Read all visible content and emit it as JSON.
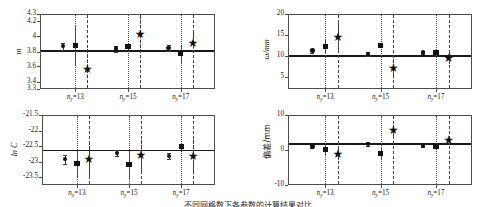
{
  "figure": {
    "caption": "不同网格数下各参数的计算结果对比",
    "group_labels": [
      "n",
      "=13",
      "n",
      "=15",
      "n",
      "=17"
    ],
    "group_var": "n",
    "group_sub": "y",
    "group_values": [
      "13",
      "15",
      "17"
    ]
  },
  "chart_data": [
    {
      "id": "panel-m",
      "type": "scatter",
      "title": "",
      "xlabel": "",
      "ylabel": "m",
      "ylabel_style": "italic",
      "ylim": [
        3.3,
        4.3
      ],
      "yticks": [
        3.3,
        3.4,
        3.6,
        3.8,
        4.0,
        4.2,
        4.3
      ],
      "ytick_labels": [
        "3.3",
        "3.4",
        "3.6",
        "3.8",
        "4",
        "4.2",
        "4.3"
      ],
      "categories": [
        "n_y=13",
        "n_y=15",
        "n_y=17"
      ],
      "reference_line": 3.82,
      "grid": false,
      "legend": "none",
      "series": [
        {
          "name": "circle",
          "marker": "circle",
          "x": [
            0.74,
            1.74,
            2.74
          ],
          "values": [
            3.87,
            3.84,
            3.85
          ],
          "err_low": [
            0.05,
            0.04,
            0.04
          ],
          "err_high": [
            0.05,
            0.04,
            0.04
          ],
          "err_style": "solid"
        },
        {
          "name": "square",
          "marker": "square",
          "x": [
            0.97,
            1.97,
            2.97
          ],
          "values": [
            3.88,
            3.87,
            3.77
          ],
          "err_low": [
            0.26,
            0.15,
            0.12
          ],
          "err_high": [
            0.26,
            0.15,
            0.12
          ],
          "err_style": "dotted"
        },
        {
          "name": "star",
          "marker": "star",
          "x": [
            1.2,
            2.2,
            3.2
          ],
          "values": [
            3.57,
            4.04,
            3.92
          ],
          "err_low": [
            0.27,
            0.24,
            0.14
          ],
          "err_high": [
            0.27,
            0.24,
            0.14
          ],
          "err_style": "dashed"
        }
      ]
    },
    {
      "id": "panel-omega",
      "type": "scatter",
      "title": "",
      "xlabel": "",
      "ylabel": "ω/mm",
      "ylabel_style": "italic",
      "ylim": [
        2.0,
        20.0
      ],
      "yticks": [
        5,
        10,
        15,
        20
      ],
      "ytick_labels": [
        "5",
        "10",
        "15",
        "20"
      ],
      "categories": [
        "n_y=13",
        "n_y=15",
        "n_y=17"
      ],
      "reference_line": 10.1,
      "grid": false,
      "legend": "none",
      "series": [
        {
          "name": "circle",
          "marker": "circle",
          "x": [
            0.74,
            1.74,
            2.74
          ],
          "values": [
            11.2,
            10.4,
            10.8
          ],
          "err_low": [
            0.5,
            0.4,
            0.4
          ],
          "err_high": [
            0.5,
            0.4,
            0.4
          ],
          "err_style": "solid"
        },
        {
          "name": "square",
          "marker": "square",
          "x": [
            0.97,
            1.97,
            2.97
          ],
          "values": [
            12.2,
            12.4,
            10.7
          ],
          "err_low": [
            1.6,
            1.5,
            0.9
          ],
          "err_high": [
            1.6,
            1.5,
            0.9
          ],
          "err_style": "dotted"
        },
        {
          "name": "star",
          "marker": "star",
          "x": [
            1.2,
            2.2,
            3.2
          ],
          "values": [
            14.6,
            7.1,
            9.4
          ],
          "err_low": [
            3.3,
            2.0,
            1.4
          ],
          "err_high": [
            3.3,
            2.0,
            1.4
          ],
          "err_style": "dashed"
        }
      ]
    },
    {
      "id": "panel-lnc",
      "type": "scatter",
      "title": "",
      "xlabel": "",
      "ylabel": "ln C",
      "ylabel_style": "italic",
      "ylim": [
        -23.75,
        -21.5
      ],
      "yticks": [
        -21.5,
        -22.0,
        -22.5,
        -23.0,
        -23.5
      ],
      "ytick_labels": [
        "-21.5",
        "-22",
        "-22.5",
        "-23",
        "-23.5"
      ],
      "categories": [
        "n_y=13",
        "n_y=15",
        "n_y=17"
      ],
      "reference_line": -22.62,
      "grid": false,
      "legend": "none",
      "series": [
        {
          "name": "circle",
          "marker": "circle",
          "x": [
            0.74,
            1.74,
            2.74
          ],
          "values": [
            -22.92,
            -22.72,
            -22.81
          ],
          "err_low": [
            0.14,
            0.1,
            0.1
          ],
          "err_high": [
            0.14,
            0.1,
            0.1
          ],
          "err_style": "solid"
        },
        {
          "name": "square",
          "marker": "square",
          "x": [
            0.97,
            1.97,
            2.97
          ],
          "values": [
            -23.05,
            -23.1,
            -22.52
          ],
          "err_low": [
            0.45,
            0.45,
            0.5
          ],
          "err_high": [
            0.45,
            0.45,
            0.5
          ],
          "err_style": "dotted"
        },
        {
          "name": "star",
          "marker": "star",
          "x": [
            1.2,
            2.2,
            3.2
          ],
          "values": [
            -22.93,
            -22.79,
            -22.81
          ],
          "err_low": [
            0.55,
            0.5,
            0.52
          ],
          "err_high": [
            0.55,
            0.5,
            0.52
          ],
          "err_style": "dashed"
        }
      ]
    },
    {
      "id": "panel-deviation",
      "type": "scatter",
      "title": "",
      "xlabel": "",
      "ylabel": "偏差/mm",
      "ylabel_style": "cjk",
      "ylim": [
        -10,
        10
      ],
      "yticks": [
        -10,
        0,
        10
      ],
      "ytick_labels": [
        "-10",
        "0",
        "10"
      ],
      "categories": [
        "n_y=13",
        "n_y=15",
        "n_y=17"
      ],
      "reference_line": 1.9,
      "grid": false,
      "legend": "none",
      "series": [
        {
          "name": "circle",
          "marker": "circle",
          "x": [
            0.74,
            1.74,
            2.74
          ],
          "values": [
            1.0,
            1.7,
            1.3
          ],
          "err_low": [
            0.5,
            0.5,
            0.4
          ],
          "err_high": [
            0.5,
            0.5,
            0.4
          ],
          "err_style": "solid"
        },
        {
          "name": "square",
          "marker": "square",
          "x": [
            0.97,
            1.97,
            2.97
          ],
          "values": [
            0.2,
            -0.9,
            1.0
          ],
          "err_low": [
            1.5,
            1.6,
            0.9
          ],
          "err_high": [
            1.5,
            1.6,
            0.9
          ],
          "err_style": "dotted"
        },
        {
          "name": "star",
          "marker": "star",
          "x": [
            1.2,
            2.2,
            3.2
          ],
          "values": [
            -1.2,
            5.6,
            2.8
          ],
          "err_low": [
            1.8,
            1.6,
            1.3
          ],
          "err_high": [
            1.8,
            1.6,
            1.3
          ],
          "err_style": "dashed"
        }
      ]
    }
  ]
}
